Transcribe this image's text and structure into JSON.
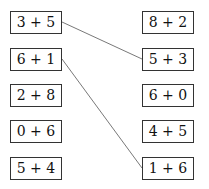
{
  "left": [
    {
      "label": "3 + 5"
    },
    {
      "label": "6 + 1"
    },
    {
      "label": "2 + 8"
    },
    {
      "label": "0 + 6"
    },
    {
      "label": "5 + 4"
    }
  ],
  "right": [
    {
      "label": "8 + 2"
    },
    {
      "label": "5 + 3"
    },
    {
      "label": "6 + 0"
    },
    {
      "label": "4 + 5"
    },
    {
      "label": "1 + 6"
    }
  ],
  "connections": [
    {
      "from": "3 + 5",
      "to": "5 + 3"
    },
    {
      "from": "6 + 1",
      "to": "1 + 6"
    }
  ]
}
